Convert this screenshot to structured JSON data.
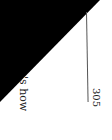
{
  "page": {
    "body_fragment": "'s how",
    "page_number": "305"
  },
  "colors": {
    "scan_background": "#000000",
    "paper": "#ffffff",
    "rule": "#555555"
  }
}
